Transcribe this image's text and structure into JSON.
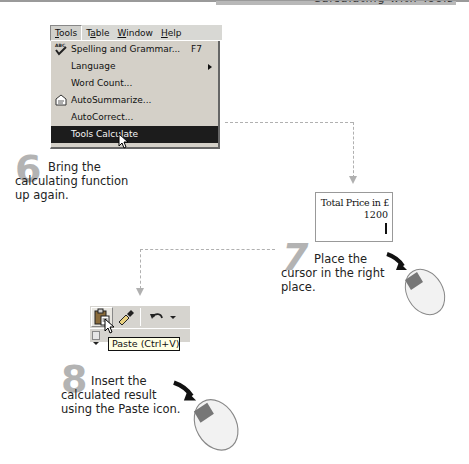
{
  "page": {
    "header_text": "Calculating with Tools"
  },
  "menu": {
    "menubar": [
      {
        "label": "Tools",
        "active": true
      },
      {
        "label": "Table",
        "active": false
      },
      {
        "label": "Window",
        "active": false
      },
      {
        "label": "Help",
        "active": false
      }
    ],
    "items": [
      {
        "label": "Spelling and Grammar...",
        "shortcut": "F7",
        "icon": "spelling-check-icon"
      },
      {
        "label": "Language",
        "submenu": true
      },
      {
        "label": "Word Count..."
      },
      {
        "label": "AutoSummarize...",
        "icon": "autosummarize-icon"
      },
      {
        "label": "AutoCorrect..."
      },
      {
        "label": "Tools Calculate",
        "highlighted": true
      }
    ]
  },
  "steps": [
    {
      "number": "6",
      "text_line1": "Bring the",
      "text_line2": "calculating function",
      "text_line3": "up again."
    },
    {
      "number": "7",
      "text_line1": "Place the",
      "text_line2": "cursor in the right",
      "text_line3": "place."
    },
    {
      "number": "8",
      "text_line1": "Insert the",
      "text_line2": "calculated result",
      "text_line3": "using the Paste icon."
    }
  ],
  "cell": {
    "label": "Total Price in £",
    "value": "1200"
  },
  "toolbar": {
    "buttons": [
      "paste-icon",
      "format-painter-icon",
      "undo-icon"
    ],
    "tooltip": "Paste (Ctrl+V)"
  },
  "colors": {
    "step_number": "#b3b3b3",
    "menu_bg": "#d4d0c8",
    "highlight_bg": "#1c1c1c",
    "tooltip_bg": "#ffffe4",
    "connector": "#b0b0b0"
  }
}
